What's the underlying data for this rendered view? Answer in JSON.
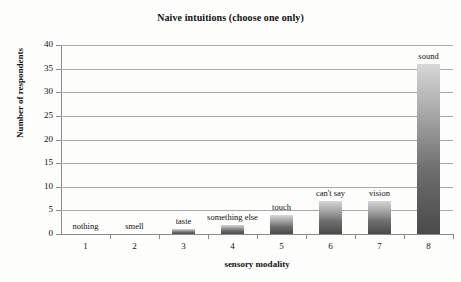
{
  "chart_data": {
    "type": "bar",
    "title": "Naive intuitions (choose one only)",
    "xlabel": "sensory modality",
    "ylabel": "Number of respondents",
    "categories": [
      "1",
      "2",
      "3",
      "4",
      "5",
      "6",
      "7",
      "8"
    ],
    "point_labels": [
      "nothing",
      "smell",
      "taste",
      "something else",
      "touch",
      "can't say",
      "vision",
      "sound"
    ],
    "values": [
      0,
      0,
      1,
      2,
      4,
      7,
      7,
      36
    ],
    "ylim": [
      0,
      40
    ],
    "ytick_values": [
      "0",
      "5",
      "10",
      "15",
      "20",
      "25",
      "30",
      "35",
      "40"
    ],
    "grid": true,
    "legend": "none",
    "bar_color_top": "#d7d7d7",
    "bar_color_bottom": "#4a4a4a",
    "axis_color": "#8a8a8a",
    "gridline_color": "#a8a8a8",
    "background_color": "#fdfdfc"
  }
}
